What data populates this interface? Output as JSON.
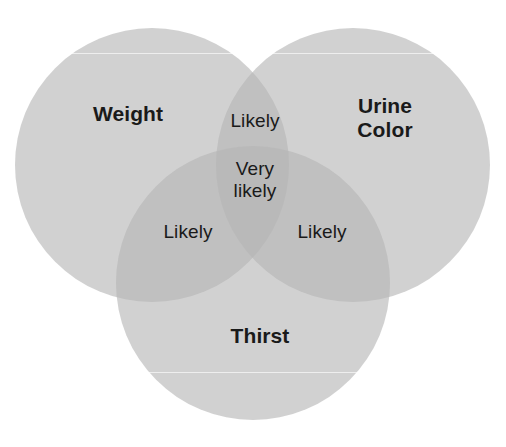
{
  "figure": {
    "type": "venn-diagram-3-set",
    "background_color": "#ffffff",
    "width": 506,
    "height": 447
  },
  "palette": {
    "circle_fill": "#b5b5b5",
    "circle_fill_opacity": 0.62,
    "single_region_color": "#c8c8c8",
    "double_overlap_color": "#a0a0a0",
    "triple_overlap_color": "#8a8a8a",
    "text_color": "#1a1a1a"
  },
  "sets": [
    {
      "key": "weight",
      "label": "Weight",
      "position": "top-left",
      "cx": 152,
      "cy": 165,
      "r": 137,
      "label_x": 128,
      "label_y": 114
    },
    {
      "key": "urine_color",
      "label": "Urine\nColor",
      "position": "top-right",
      "cx": 353,
      "cy": 165,
      "r": 137,
      "label_x": 385,
      "label_y": 118
    },
    {
      "key": "thirst",
      "label": "Thirst",
      "position": "bottom",
      "cx": 253,
      "cy": 283,
      "r": 137,
      "label_x": 260,
      "label_y": 336
    }
  ],
  "regions": [
    {
      "key": "weight_urine",
      "label": "Likely",
      "sets": [
        "weight",
        "urine_color"
      ],
      "overlap": 2,
      "x": 255,
      "y": 121
    },
    {
      "key": "all_three",
      "label": "Very\nlikely",
      "sets": [
        "weight",
        "urine_color",
        "thirst"
      ],
      "overlap": 3,
      "x": 255,
      "y": 180
    },
    {
      "key": "weight_thirst",
      "label": "Likely",
      "sets": [
        "weight",
        "thirst"
      ],
      "overlap": 2,
      "x": 188,
      "y": 232
    },
    {
      "key": "urine_thirst",
      "label": "Likely",
      "sets": [
        "urine_color",
        "thirst"
      ],
      "overlap": 2,
      "x": 322,
      "y": 232
    }
  ],
  "artifacts": {
    "scanlines_y": [
      53,
      372
    ]
  }
}
